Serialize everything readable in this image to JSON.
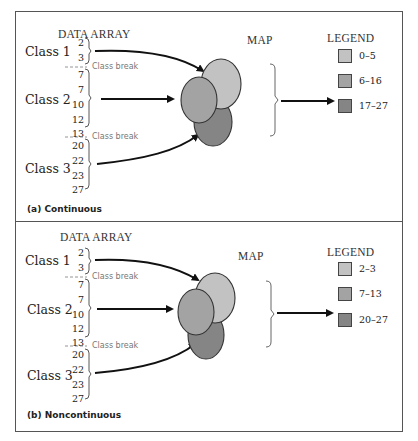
{
  "colors": {
    "light": "#c2c2c2",
    "medium": "#a3a3a3",
    "dark": "#858585",
    "outline": "#333333",
    "break_line": "#888888"
  },
  "panels": [
    {
      "id": "a",
      "data_array_title": "DATA ARRAY",
      "map_title": "MAP",
      "legend_title": "LEGEND",
      "classes": [
        {
          "label": "Class 1",
          "values": [
            "2",
            "3"
          ]
        },
        {
          "label": "Class 2",
          "values": [
            "7",
            "7",
            "10",
            "12",
            "13"
          ]
        },
        {
          "label": "Class 3",
          "values": [
            "20",
            "22",
            "23",
            "27"
          ]
        }
      ],
      "class_break_label": "Class break",
      "legend": [
        {
          "range": "0–5",
          "color": "light"
        },
        {
          "range": "6–16",
          "color": "medium"
        },
        {
          "range": "17–27",
          "color": "dark"
        }
      ],
      "caption": "(a) Continuous"
    },
    {
      "id": "b",
      "data_array_title": "DATA ARRAY",
      "map_title": "MAP",
      "legend_title": "LEGEND",
      "classes": [
        {
          "label": "Class 1",
          "values": [
            "2",
            "3"
          ]
        },
        {
          "label": "Class 2",
          "values": [
            "7",
            "7",
            "10",
            "12",
            "13"
          ]
        },
        {
          "label": "Class 3",
          "values": [
            "20",
            "22",
            "23",
            "27"
          ]
        }
      ],
      "class_break_label": "Class break",
      "legend": [
        {
          "range": "2–3",
          "color": "light"
        },
        {
          "range": "7–13",
          "color": "medium"
        },
        {
          "range": "20–27",
          "color": "dark"
        }
      ],
      "caption": "(b) Noncontinuous"
    }
  ]
}
